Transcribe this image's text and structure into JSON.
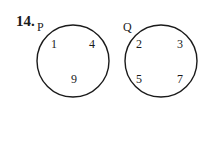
{
  "question": {
    "number": "14."
  },
  "sets": [
    {
      "name": "P",
      "cx": 73,
      "cy": 61,
      "r": 36,
      "label_pos": [
        37,
        20
      ],
      "elements": [
        {
          "value": "1",
          "x": 51,
          "y": 37
        },
        {
          "value": "4",
          "x": 89,
          "y": 37
        },
        {
          "value": "9",
          "x": 71,
          "y": 72
        }
      ]
    },
    {
      "name": "Q",
      "cx": 161,
      "cy": 61,
      "r": 36,
      "label_pos": [
        123,
        20
      ],
      "elements": [
        {
          "value": "2",
          "x": 136,
          "y": 37
        },
        {
          "value": "3",
          "x": 177,
          "y": 37
        },
        {
          "value": "5",
          "x": 136,
          "y": 72
        },
        {
          "value": "7",
          "x": 177,
          "y": 72
        }
      ]
    }
  ],
  "style": {
    "stroke": "#1a1a1a",
    "stroke_width": 1.4
  }
}
